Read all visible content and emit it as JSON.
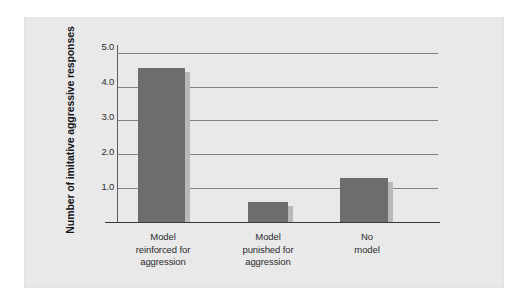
{
  "chart_data": {
    "type": "bar",
    "title": "",
    "subtitle": "",
    "xlabel": "",
    "ylabel": "Number of imitative aggressive responses",
    "categories": [
      "Model\nreinforced for\naggression",
      "Model\npunished for\naggression",
      "No\nmodel"
    ],
    "category_lines": [
      [
        "Model",
        "reinforced for",
        "aggression"
      ],
      [
        "Model",
        "punished for",
        "aggression"
      ],
      [
        "No",
        "model"
      ]
    ],
    "values": [
      4.55,
      0.6,
      1.3
    ],
    "ylim": [
      0,
      5.2
    ],
    "yticks": [
      1.0,
      2.0,
      3.0,
      4.0,
      5.0
    ],
    "ytick_labels": [
      "1.0",
      "2.0",
      "3.0",
      "4.0",
      "5.0"
    ],
    "grid": "horizontal",
    "legend": "none",
    "bar_color": "#6d6d6f",
    "bar_shadow_color": "#b8b8ba",
    "panel_color": "#e9e9e9",
    "gridline_color": "#6e6e70",
    "axis_color": "#3a3a3c",
    "text_color": "#2b2b2e"
  }
}
